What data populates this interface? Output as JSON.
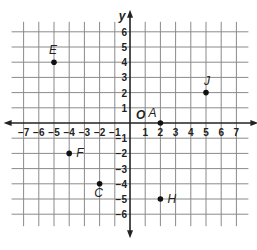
{
  "chart_data": {
    "type": "scatter",
    "title": "",
    "xlabel": "x",
    "ylabel": "y",
    "origin_label": "O",
    "xlim": [
      -7,
      7
    ],
    "ylim": [
      -6,
      6
    ],
    "grid": true,
    "x_ticks": [
      "-7",
      "-6",
      "-5",
      "-4",
      "-3",
      "-2",
      "-1",
      "1",
      "2",
      "3",
      "4",
      "5",
      "6",
      "7"
    ],
    "y_ticks": [
      "6",
      "5",
      "4",
      "3",
      "2",
      "1",
      "-1",
      "-2",
      "-3",
      "-4",
      "-5",
      "-6"
    ],
    "points": [
      {
        "label": "E",
        "x": -5,
        "y": 4
      },
      {
        "label": "J",
        "x": 5,
        "y": 2
      },
      {
        "label": "A",
        "x": 2,
        "y": 0
      },
      {
        "label": "F",
        "x": -4,
        "y": -2
      },
      {
        "label": "C",
        "x": -2,
        "y": -4
      },
      {
        "label": "H",
        "x": 2,
        "y": -5
      }
    ]
  },
  "colors": {
    "grid": "#8a8a8a",
    "axis": "#222222",
    "point": "#111111",
    "background": "#ffffff"
  }
}
